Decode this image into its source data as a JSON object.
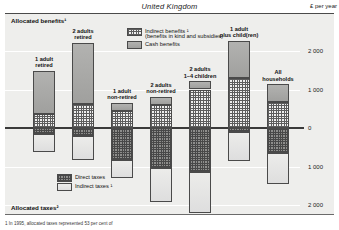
{
  "header": {
    "country": "United Kingdom",
    "units": "£ per year"
  },
  "sections": {
    "benefits_title": "Allocated benefits¹",
    "taxes_title": "Allocated taxes²"
  },
  "legend_benefits": [
    {
      "key": "indirect-benefits",
      "label_line1": "Indirect benefits ¹",
      "label_line2": "(benefits in kind and subsidies)"
    },
    {
      "key": "cash-benefits",
      "label_line1": "Cash benefits",
      "label_line2": ""
    }
  ],
  "legend_taxes": [
    {
      "key": "direct-taxes",
      "label_line1": "Direct taxes",
      "label_line2": ""
    },
    {
      "key": "indirect-taxes",
      "label_line1": "Indirect taxes ¹",
      "label_line2": ""
    }
  ],
  "footnote": "1 In 1995, allocated taxes represented 53 per cent of",
  "chart_data": {
    "type": "bar",
    "title": "United Kingdom",
    "subtitle": "Allocated benefits and allocated taxes by household type",
    "xlabel": "",
    "ylabel": "£ per year",
    "ylim": [
      -2400,
      2400
    ],
    "yticks": [
      2000,
      1000,
      0,
      -1000,
      -2000
    ],
    "ytick_labels": [
      "2 000",
      "1 000",
      "0",
      "1 000",
      "2 000"
    ],
    "grid": true,
    "stacked": true,
    "legend_position": "inside-top",
    "categories": [
      "1 adult retired",
      "2 adults retired",
      "1 adult non-retired",
      "2 adults non-retired",
      "2 adults 1–4 children",
      "1 adult plus child(ren)",
      "All households"
    ],
    "series": [
      {
        "name": "Indirect benefits ¹ (benefits in kind and subsidies)",
        "pattern": "checkered",
        "values": [
          370,
          620,
          440,
          600,
          1000,
          1300,
          680
        ]
      },
      {
        "name": "Cash benefits",
        "pattern": "solid-grey",
        "values": [
          1110,
          1590,
          210,
          210,
          210,
          960,
          450
        ]
      },
      {
        "name": "Direct taxes",
        "pattern": "dark-checkered",
        "values": [
          -160,
          -210,
          -830,
          -1040,
          -1140,
          -100,
          -650
        ]
      },
      {
        "name": "Indirect taxes ¹",
        "pattern": "light",
        "values": [
          -470,
          -620,
          -470,
          -880,
          -1060,
          -750,
          -800
        ]
      }
    ]
  }
}
